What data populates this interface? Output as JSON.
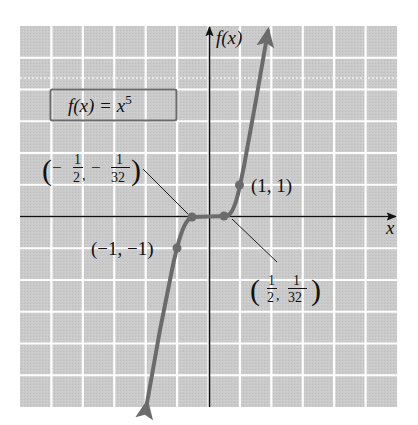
{
  "chart_data": {
    "type": "line",
    "title": "",
    "function_label": "f(x) = x^5",
    "function_label_parts": {
      "lhs": "f(x) = x",
      "exponent": "5"
    },
    "xlabel": "x",
    "ylabel": "f(x)",
    "xlim": [
      -6,
      6
    ],
    "ylim": [
      -6,
      6
    ],
    "grid": true,
    "tick_labels": false,
    "series": [
      {
        "name": "f(x) = x^5",
        "x": [
          -1.43,
          -1,
          -0.5,
          0,
          0.5,
          1,
          1.43
        ],
        "y": [
          -6,
          -1,
          -0.03125,
          0,
          0.03125,
          1,
          6
        ]
      }
    ],
    "annotations": [
      {
        "point": [
          -0.5,
          -0.03125
        ],
        "label": "(-1/2, -1/32)",
        "parts": {
          "x_num": "1",
          "x_den": "2",
          "y_num": "1",
          "y_den": "32",
          "x_sign": "−",
          "y_sign": "−"
        }
      },
      {
        "point": [
          0.5,
          0.03125
        ],
        "label": "(1/2, 1/32)",
        "parts": {
          "x_num": "1",
          "x_den": "2",
          "y_num": "1",
          "y_den": "32"
        }
      },
      {
        "point": [
          1,
          1
        ],
        "label": "(1, 1)"
      },
      {
        "point": [
          -1,
          -1
        ],
        "label": "(−1, −1)"
      }
    ],
    "colors": {
      "grid_background": "#c9c9c9",
      "grid_lines": "#ffffff",
      "curve": "#6b6b6b",
      "axes": "#111111",
      "label_box_border": "#6b6b6b"
    }
  }
}
